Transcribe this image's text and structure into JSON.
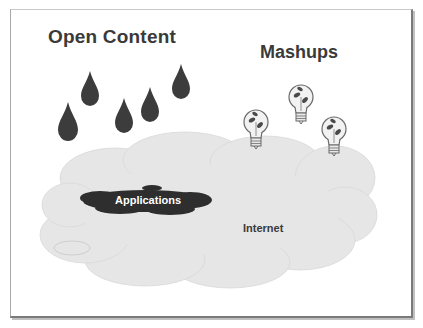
{
  "slide": {
    "title_left": "Open Content",
    "title_right": "Mashups",
    "applications_label": "Applications",
    "internet_label": "Internet"
  },
  "icons": {
    "drops": [
      "raindrop-icon",
      "raindrop-icon",
      "raindrop-icon",
      "raindrop-icon",
      "raindrop-icon",
      "raindrop-icon"
    ],
    "bulbs": [
      "lightbulb-icon",
      "lightbulb-icon",
      "lightbulb-icon"
    ],
    "cloud": "cloud-icon",
    "puddle": "puddle-icon"
  },
  "colors": {
    "drop": "#3c3c3c",
    "cloud": "#e6e6e6",
    "puddle": "#2e2e2e",
    "text": "#3a3a3a"
  }
}
